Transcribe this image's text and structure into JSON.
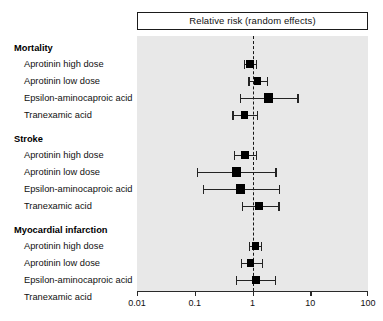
{
  "header": {
    "title": "Relative risk (random effects)"
  },
  "axis": {
    "scale": "log",
    "min": 0.01,
    "max": 100,
    "ticks": [
      {
        "value": 0.01,
        "label": "0.01"
      },
      {
        "value": 0.1,
        "label": "0.1"
      },
      {
        "value": 1,
        "label": "1"
      },
      {
        "value": 10,
        "label": "10"
      },
      {
        "value": 100,
        "label": "100"
      }
    ],
    "reference_line": 1
  },
  "colors": {
    "panel_background": "#e8e8e8",
    "marker": "#000000",
    "line": "#232323",
    "text": "#111111",
    "page_background": "#ffffff"
  },
  "chart_data": {
    "type": "forest",
    "title": "Relative risk (random effects)",
    "xlabel": "",
    "ylabel": "",
    "xscale": "log",
    "xlim": [
      0.01,
      100
    ],
    "reference_line": 1,
    "grid": false,
    "legend": "none",
    "groups": [
      {
        "name": "Mortality",
        "rows": [
          {
            "label": "Aprotinin high dose",
            "rr": 0.9,
            "ci_low": 0.72,
            "ci_high": 1.13,
            "marker_size": "medium"
          },
          {
            "label": "Aprotinin low dose",
            "rr": 1.22,
            "ci_low": 0.85,
            "ci_high": 1.75,
            "marker_size": "medium"
          },
          {
            "label": "Epsilon-aminocaproic acid",
            "rr": 1.9,
            "ci_low": 0.6,
            "ci_high": 6.0,
            "marker_size": "large"
          },
          {
            "label": "Tranexamic acid",
            "rr": 0.73,
            "ci_low": 0.45,
            "ci_high": 1.18,
            "marker_size": "medium"
          }
        ]
      },
      {
        "name": "Stroke",
        "rows": [
          {
            "label": "Aprotinin high dose",
            "rr": 0.74,
            "ci_low": 0.47,
            "ci_high": 1.16,
            "marker_size": "medium"
          },
          {
            "label": "Aprotinin low dose",
            "rr": 0.53,
            "ci_low": 0.11,
            "ci_high": 2.5,
            "marker_size": "large"
          },
          {
            "label": "Epsilon-aminocaproic acid",
            "rr": 0.62,
            "ci_low": 0.14,
            "ci_high": 2.9,
            "marker_size": "large"
          },
          {
            "label": "Tranexamic acid",
            "rr": 1.3,
            "ci_low": 0.66,
            "ci_high": 2.8,
            "marker_size": "medium"
          }
        ]
      },
      {
        "name": "Myocardial infarction",
        "rows": [
          {
            "label": "Aprotinin high dose",
            "rr": 1.12,
            "ci_low": 0.88,
            "ci_high": 1.42,
            "marker_size": "medium"
          },
          {
            "label": "Aprotinin low dose",
            "rr": 0.93,
            "ci_low": 0.62,
            "ci_high": 1.45,
            "marker_size": "medium"
          },
          {
            "label": "Epsilon-aminocaproic acid",
            "rr": 1.15,
            "ci_low": 0.52,
            "ci_high": 2.45,
            "marker_size": "medium"
          },
          {
            "label": "Tranexamic acid",
            "rr": 1.02,
            "ci_low": 0.6,
            "ci_high": 1.72,
            "marker_size": "medium"
          }
        ]
      }
    ]
  }
}
